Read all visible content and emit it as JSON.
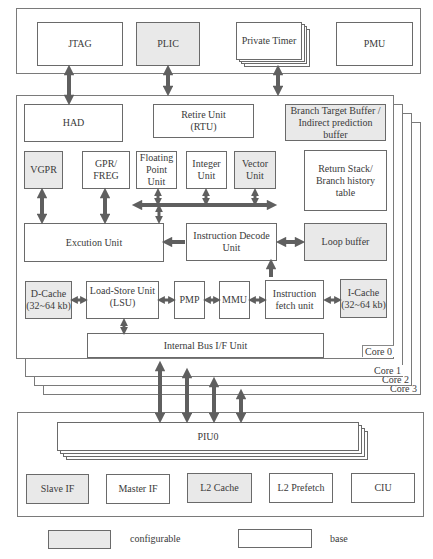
{
  "top_block": {
    "items": [
      {
        "label": "JTAG",
        "type": "base"
      },
      {
        "label": "PLIC",
        "type": "configurable"
      },
      {
        "label": "Private Timer",
        "type": "base",
        "stacked": true
      },
      {
        "label": "PMU",
        "type": "base"
      }
    ]
  },
  "core": {
    "labels": [
      "Core 0",
      "Core 1",
      "Core 2",
      "Core 3"
    ],
    "had": "HAD",
    "rtu": {
      "line1": "Retire Unit",
      "line2": "(RTU)"
    },
    "btb": {
      "line1": "Branch Target Buffer /",
      "line2": "Indirect prediction",
      "line3": "buffer"
    },
    "vgpr": "VGPR",
    "gpr": {
      "line1": "GPR/",
      "line2": "FREG"
    },
    "fpu": {
      "line1": "Floating",
      "line2": "Point",
      "line3": "Unit"
    },
    "integer": {
      "line1": "Integer",
      "line2": "Unit"
    },
    "vector": {
      "line1": "Vector",
      "line2": "Unit"
    },
    "return_stack": {
      "line1": "Return Stack/",
      "line2": "Branch history",
      "line3": "table"
    },
    "execution": "Excution Unit",
    "decode": {
      "line1": "Instruction Decode",
      "line2": "Unit"
    },
    "loop_buffer": "Loop buffer",
    "dcache": {
      "line1": "D-Cache",
      "line2": "(32~64 kb)"
    },
    "lsu": {
      "line1": "Load-Store Unit",
      "line2": "(LSU)"
    },
    "pmp": "PMP",
    "mmu": "MMU",
    "fetch": {
      "line1": "Instruction",
      "line2": "fetch unit"
    },
    "icache": {
      "line1": "I-Cache",
      "line2": "(32~64 kb)"
    },
    "bus_if": "Internal Bus I/F Unit"
  },
  "piu_block": {
    "piu": "PIU0",
    "items": [
      {
        "label": "Slave IF",
        "type": "configurable"
      },
      {
        "label": "Master IF",
        "type": "base"
      },
      {
        "label": "L2 Cache",
        "type": "configurable"
      },
      {
        "label": "L2 Prefetch",
        "type": "base"
      },
      {
        "label": "CIU",
        "type": "base"
      }
    ]
  },
  "legend": {
    "configurable": "configurable",
    "base": "base",
    "colors": {
      "configurable": "#e9e9e9",
      "base": "#ffffff",
      "arrow": "#5f5f5f"
    }
  }
}
